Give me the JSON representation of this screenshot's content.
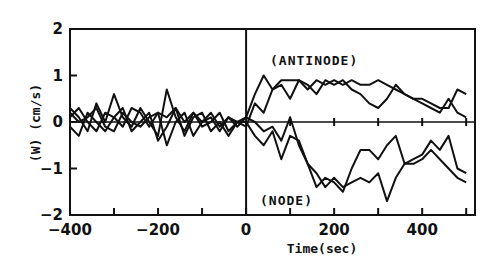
{
  "chart_data": {
    "type": "line",
    "title": "",
    "xlabel": "Time(sec)",
    "ylabel": "(W) (cm/s)",
    "xlim": [
      -400,
      520
    ],
    "ylim": [
      -2,
      2
    ],
    "x_ticks": [
      -400,
      -200,
      0,
      200,
      400
    ],
    "x_tick_labels": [
      "-400",
      "-200",
      "0",
      "200",
      "400"
    ],
    "y_ticks": [
      2,
      1,
      0,
      -1,
      -2
    ],
    "y_tick_labels": [
      "2",
      "1",
      "0",
      "-1",
      "-2"
    ],
    "grid": false,
    "annotations": [
      {
        "text": "(ANTINODE)",
        "x": 70,
        "y": 1.1
      },
      {
        "text": "(NODE)",
        "x": 30,
        "y": -1.65
      }
    ],
    "reference_lines": [
      {
        "type": "vline",
        "x": 0
      },
      {
        "type": "hline",
        "y": 0
      }
    ],
    "series": [
      {
        "name": "antinode-1",
        "x": [
          -400,
          -380,
          -360,
          -340,
          -320,
          -300,
          -280,
          -260,
          -240,
          -220,
          -200,
          -180,
          -160,
          -140,
          -120,
          -100,
          -80,
          -60,
          -40,
          -20,
          0,
          20,
          40,
          60,
          80,
          100,
          120,
          140,
          160,
          180,
          200,
          220,
          240,
          260,
          280,
          300,
          320,
          340,
          360,
          380,
          400,
          420,
          440,
          460,
          480,
          500
        ],
        "y": [
          0.3,
          0.1,
          -0.2,
          0.4,
          0.0,
          0.6,
          0.1,
          -0.1,
          0.3,
          0.0,
          -0.3,
          0.7,
          0.1,
          -0.2,
          0.2,
          0.0,
          0.1,
          -0.2,
          0.1,
          0.0,
          0.1,
          0.6,
          1.0,
          0.7,
          0.8,
          0.5,
          0.9,
          0.8,
          0.6,
          0.9,
          0.8,
          0.9,
          0.7,
          0.6,
          0.4,
          0.3,
          0.5,
          0.8,
          0.6,
          0.5,
          0.4,
          0.3,
          0.2,
          0.5,
          0.2,
          0.1
        ]
      },
      {
        "name": "antinode-2",
        "x": [
          -400,
          -380,
          -360,
          -340,
          -320,
          -300,
          -280,
          -260,
          -240,
          -220,
          -200,
          -180,
          -160,
          -140,
          -120,
          -100,
          -80,
          -60,
          -40,
          -20,
          0,
          20,
          40,
          60,
          80,
          100,
          120,
          140,
          160,
          180,
          200,
          220,
          240,
          260,
          280,
          300,
          320,
          340,
          360,
          380,
          400,
          420,
          440,
          460,
          480,
          500
        ],
        "y": [
          0.1,
          0.3,
          0.0,
          -0.2,
          0.2,
          0.1,
          -0.1,
          0.3,
          0.2,
          -0.1,
          0.2,
          0.1,
          0.3,
          0.0,
          0.2,
          -0.1,
          0.0,
          0.2,
          -0.2,
          0.0,
          -0.1,
          0.4,
          0.2,
          0.7,
          0.9,
          0.9,
          0.9,
          0.7,
          0.9,
          0.8,
          0.9,
          0.8,
          0.9,
          0.8,
          0.8,
          0.9,
          0.8,
          0.7,
          0.6,
          0.5,
          0.5,
          0.4,
          0.3,
          0.3,
          0.7,
          0.6
        ]
      },
      {
        "name": "node-1",
        "x": [
          -400,
          -380,
          -360,
          -340,
          -320,
          -300,
          -280,
          -260,
          -240,
          -220,
          -200,
          -180,
          -160,
          -140,
          -120,
          -100,
          -80,
          -60,
          -40,
          -20,
          0,
          20,
          40,
          60,
          80,
          100,
          120,
          140,
          160,
          180,
          200,
          220,
          240,
          260,
          280,
          300,
          320,
          340,
          360,
          380,
          400,
          420,
          440,
          460,
          480,
          500
        ],
        "y": [
          -0.1,
          -0.3,
          0.2,
          0.0,
          -0.2,
          0.1,
          0.3,
          -0.2,
          0.0,
          0.2,
          -0.4,
          -0.1,
          0.3,
          -0.3,
          0.1,
          0.2,
          -0.2,
          0.0,
          -0.3,
          0.0,
          0.0,
          -0.3,
          -0.5,
          -0.2,
          -0.8,
          -0.3,
          -0.4,
          -0.9,
          -1.4,
          -1.2,
          -1.3,
          -1.5,
          -1.0,
          -0.6,
          -0.6,
          -0.8,
          -0.5,
          -0.3,
          -0.9,
          -0.8,
          -0.7,
          -0.4,
          -0.6,
          -0.3,
          -1.0,
          -1.1
        ]
      },
      {
        "name": "node-2",
        "x": [
          -400,
          -380,
          -360,
          -340,
          -320,
          -300,
          -280,
          -260,
          -240,
          -220,
          -200,
          -180,
          -160,
          -140,
          -120,
          -100,
          -80,
          -60,
          -40,
          -20,
          0,
          20,
          40,
          60,
          80,
          100,
          120,
          140,
          160,
          180,
          200,
          220,
          240,
          260,
          280,
          300,
          320,
          340,
          360,
          380,
          400,
          420,
          440,
          460,
          480,
          500
        ],
        "y": [
          0.2,
          0.0,
          0.1,
          0.3,
          -0.1,
          -0.2,
          0.2,
          0.0,
          -0.1,
          0.1,
          0.2,
          -0.5,
          0.0,
          0.2,
          -0.3,
          0.0,
          0.2,
          -0.1,
          0.1,
          -0.1,
          0.1,
          0.0,
          -0.2,
          -0.1,
          -0.4,
          0.1,
          -0.5,
          -0.9,
          -1.1,
          -1.4,
          -1.2,
          -1.4,
          -1.3,
          -1.2,
          -1.3,
          -1.1,
          -1.7,
          -1.2,
          -0.9,
          -0.9,
          -0.8,
          -0.6,
          -0.8,
          -1.0,
          -1.2,
          -1.3
        ]
      }
    ]
  }
}
